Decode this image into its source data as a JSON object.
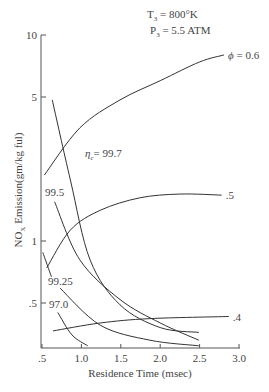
{
  "chart_data": {
    "type": "line",
    "title": "",
    "annotations": {
      "t3": "T",
      "t3_sub": "3",
      "t3_val": " = 800°K",
      "p3": "P",
      "p3_sub": "3",
      "p3_val": " = 5.5 ATM",
      "eta_sym": "η",
      "eta_sub": "c",
      "eta_val": "= 99.7"
    },
    "xlabel": "Residence Time (msec)",
    "ylabel_pre": "NO",
    "ylabel_sub": "X",
    "ylabel_post": " Emission(gm/kg ful)",
    "xlim": [
      0.5,
      3.0
    ],
    "ylim": [
      0.3,
      10
    ],
    "yscale": "log",
    "x_ticks": [
      0.5,
      1.0,
      1.5,
      2.0,
      2.5,
      3.0
    ],
    "x_tick_labels": [
      ".5",
      "1.0",
      "1.5",
      "2.0",
      "2.5",
      "3.0"
    ],
    "y_ticks": [
      0.5,
      1,
      5,
      10
    ],
    "y_tick_labels": [
      ".5",
      "1",
      "5",
      "10"
    ],
    "series": [
      {
        "name": "φ = 0.6",
        "label": "ϕ = 0.6",
        "group": "phi",
        "x": [
          0.53,
          0.98,
          1.49,
          2.0,
          2.5,
          2.81
        ],
        "y": [
          2.09,
          3.54,
          4.84,
          6.0,
          7.4,
          8.0
        ]
      },
      {
        "name": "φ = .5",
        "label": ".5",
        "group": "phi",
        "x": [
          0.56,
          0.86,
          1.24,
          1.74,
          2.25,
          2.78
        ],
        "y": [
          0.74,
          1.13,
          1.41,
          1.62,
          1.69,
          1.67
        ]
      },
      {
        "name": "φ = .4",
        "label": ".4",
        "group": "phi",
        "x": [
          0.64,
          1.24,
          1.87,
          2.87
        ],
        "y": [
          0.366,
          0.4,
          0.42,
          0.43
        ]
      },
      {
        "name": "ηc = 99.7",
        "label": "",
        "group": "eta",
        "x": [
          0.63,
          0.86,
          1.11,
          1.49,
          2.0,
          2.49
        ],
        "y": [
          4.84,
          1.98,
          0.81,
          0.49,
          0.38,
          0.36
        ]
      },
      {
        "name": "ηc = 99.5",
        "label": "99.5",
        "group": "eta",
        "x": [
          0.66,
          0.98,
          1.49,
          2.0,
          2.49
        ],
        "y": [
          1.55,
          0.81,
          0.52,
          0.4,
          0.33
        ]
      },
      {
        "name": "ηc = 99.25",
        "label": "99.25",
        "group": "eta",
        "x": [
          0.51,
          0.62
        ],
        "y": [
          0.88,
          0.67
        ],
        "x2": [
          0.73,
          1.24,
          1.87,
          2.49
        ],
        "y2": [
          0.59,
          0.39,
          0.33,
          0.31
        ]
      },
      {
        "name": "ηc = 97.0",
        "label": "97.0",
        "group": "eta",
        "x": [
          0.7,
          0.88,
          1.08
        ],
        "y": [
          0.45,
          0.35,
          0.31
        ]
      }
    ],
    "grid": false,
    "legend": "none"
  }
}
